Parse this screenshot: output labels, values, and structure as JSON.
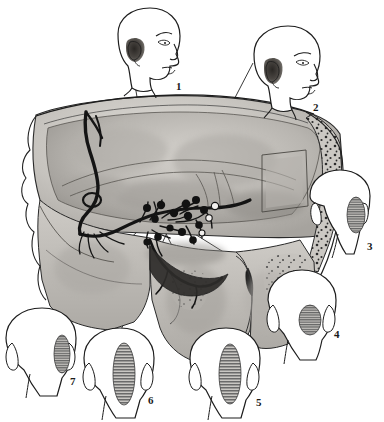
{
  "figure": {
    "type": "anatomical-line-illustration",
    "background_color": "#ffffff",
    "ink_color": "#1a1a1a",
    "bone_fill_light": "#d8d6d2",
    "bone_fill_mid": "#b9b6b1",
    "bone_fill_dark": "#8e8b87",
    "nerve_color": "#1d1d1d",
    "hatch_color": "#5a5a5a",
    "shading_color": "#9a9792"
  },
  "labels": [
    {
      "id": "1",
      "text": "1",
      "x": 176,
      "y": 90
    },
    {
      "id": "2",
      "text": "2",
      "x": 313,
      "y": 111
    },
    {
      "id": "3",
      "text": "3",
      "x": 367,
      "y": 250
    },
    {
      "id": "4",
      "text": "4",
      "x": 334,
      "y": 338
    },
    {
      "id": "5",
      "text": "5",
      "x": 256,
      "y": 406
    },
    {
      "id": "6",
      "text": "6",
      "x": 148,
      "y": 404
    },
    {
      "id": "7",
      "text": "7",
      "x": 70,
      "y": 385
    }
  ],
  "heads": [
    {
      "id": "1",
      "view": "profile-right",
      "label": "1",
      "region": "ear-auricle-dark",
      "shading": "solid-dark"
    },
    {
      "id": "2",
      "view": "profile-right",
      "label": "2",
      "region": "ear-auricle-dark",
      "shading": "solid-dark"
    },
    {
      "id": "3",
      "view": "posterior",
      "label": "3",
      "region": "retroauricular-right",
      "shading": "horizontal-hatch"
    },
    {
      "id": "4",
      "view": "posterior",
      "label": "4",
      "region": "occipital-lateral-right",
      "shading": "horizontal-hatch"
    },
    {
      "id": "5",
      "view": "posterior",
      "label": "5",
      "region": "occipital-parasagittal-right",
      "shading": "horizontal-hatch"
    },
    {
      "id": "6",
      "view": "posterior",
      "label": "6",
      "region": "occipital-parasagittal-right",
      "shading": "horizontal-hatch"
    },
    {
      "id": "7",
      "view": "posterior",
      "label": "7",
      "region": "retroauricular-right",
      "shading": "horizontal-hatch"
    }
  ],
  "leader_lines": [
    {
      "from_head": "1",
      "x1": 133,
      "y1": 73,
      "x2": 158,
      "y2": 223
    },
    {
      "from_head": "2",
      "x1": 253,
      "y1": 63,
      "x2": 171,
      "y2": 221
    },
    {
      "from_head": "3",
      "x1": 306,
      "y1": 199,
      "x2": 222,
      "y2": 199
    },
    {
      "from_head": "4",
      "x1": 281,
      "y1": 288,
      "x2": 182,
      "y2": 226
    },
    {
      "from_head": "5",
      "x1": 213,
      "y1": 327,
      "x2": 155,
      "y2": 212
    },
    {
      "from_head": "6",
      "x1": 117,
      "y1": 338,
      "x2": 176,
      "y2": 214
    },
    {
      "from_head": "7",
      "x1": 48,
      "y1": 313,
      "x2": 137,
      "y2": 232
    }
  ],
  "ganglia_nodes": [
    {
      "x": 147,
      "y": 208
    },
    {
      "x": 161,
      "y": 205
    },
    {
      "x": 155,
      "y": 219
    },
    {
      "x": 174,
      "y": 213
    },
    {
      "x": 186,
      "y": 204
    },
    {
      "x": 195,
      "y": 200
    },
    {
      "x": 188,
      "y": 216
    },
    {
      "x": 204,
      "y": 210
    },
    {
      "x": 199,
      "y": 225
    },
    {
      "x": 182,
      "y": 232
    },
    {
      "x": 170,
      "y": 228
    },
    {
      "x": 158,
      "y": 237
    },
    {
      "x": 147,
      "y": 242
    },
    {
      "x": 193,
      "y": 240
    }
  ],
  "open_nodes": [
    {
      "x": 215,
      "y": 206
    },
    {
      "x": 209,
      "y": 218
    },
    {
      "x": 202,
      "y": 233
    }
  ]
}
